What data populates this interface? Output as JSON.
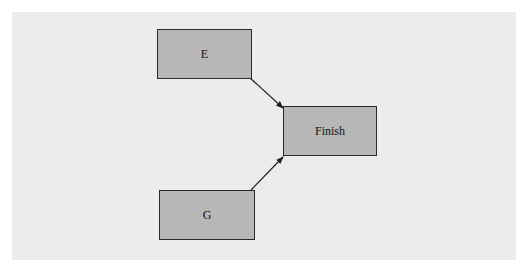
{
  "diagram": {
    "type": "network/precedence diagram",
    "nodes": [
      {
        "id": "E",
        "label": "E"
      },
      {
        "id": "G",
        "label": "G"
      },
      {
        "id": "Finish",
        "label": "Finish"
      }
    ],
    "edges": [
      {
        "from": "E",
        "to": "Finish"
      },
      {
        "from": "G",
        "to": "Finish"
      }
    ],
    "colors": {
      "background": "#ececec",
      "node_fill": "#b7b7b7",
      "node_border": "#2a2a2a",
      "edge": "#222222"
    }
  }
}
